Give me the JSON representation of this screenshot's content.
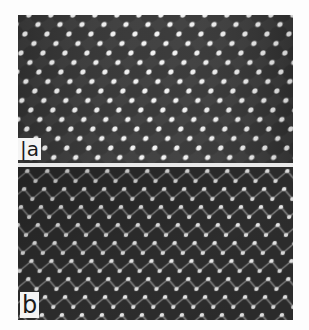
{
  "figure": {
    "panels": [
      {
        "id": "a",
        "label": "|a",
        "description": "Micrograph of close-packed lattice: dark rounded cells separated by bright nodes",
        "background_color": "#3a3a3a",
        "cell_color": "#2b2b2b",
        "node_color": "#f2f2f2"
      },
      {
        "id": "b",
        "label": "b",
        "description": "Micrograph of lattice with bright dots linked in zigzag chains on dark background",
        "background_color": "#2e2e2e",
        "dot_color": "#f5f5f5",
        "line_color": "#bfbfbf"
      }
    ]
  }
}
